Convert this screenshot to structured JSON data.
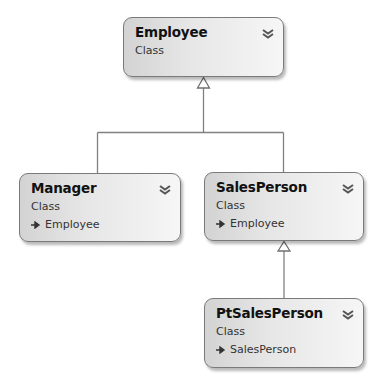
{
  "diagram": {
    "type": "class-diagram",
    "colors": {
      "box_border": "#7a7a7a",
      "box_fill_left": "#d3d3d3",
      "box_fill_right": "#f6f6f6",
      "connector": "#808080",
      "text": "#111111"
    },
    "classes": [
      {
        "id": "employee",
        "name": "Employee",
        "kind": "Class",
        "base": null,
        "collapse_icon": "double-chevron-down-icon"
      },
      {
        "id": "manager",
        "name": "Manager",
        "kind": "Class",
        "base": "Employee",
        "collapse_icon": "double-chevron-down-icon"
      },
      {
        "id": "salesperson",
        "name": "SalesPerson",
        "kind": "Class",
        "base": "Employee",
        "collapse_icon": "double-chevron-down-icon"
      },
      {
        "id": "ptsalesperson",
        "name": "PtSalesPerson",
        "kind": "Class",
        "base": "SalesPerson",
        "collapse_icon": "double-chevron-down-icon"
      }
    ],
    "inheritance": [
      {
        "from": "Manager",
        "to": "Employee"
      },
      {
        "from": "SalesPerson",
        "to": "Employee"
      },
      {
        "from": "PtSalesPerson",
        "to": "SalesPerson"
      }
    ]
  }
}
